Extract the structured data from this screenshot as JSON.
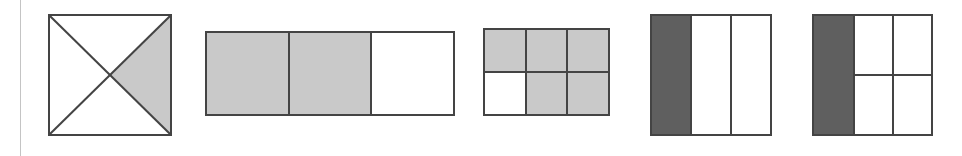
{
  "page": {
    "background_color": "#ffffff",
    "width": 962,
    "height": 156,
    "margin_rule_color": "#c4c4c4"
  },
  "palette": {
    "outline": "#444444",
    "shade_light": "#c9c9c9",
    "shade_dark": "#5f5f5f",
    "unshaded": "#ffffff"
  },
  "figures": [
    {
      "id": "figure-1",
      "name": "square-with-diagonals",
      "description": "Square divided by both diagonals into four triangles; the right triangle is shaded light gray.",
      "shape": "square",
      "division": "diagonals",
      "total_parts": 4,
      "shaded_parts": 1,
      "fraction": "1/4",
      "shade_color": "#c9c9c9",
      "shaded_regions": [
        "right"
      ],
      "x": 48,
      "y": 14,
      "width": 124,
      "height": 122
    },
    {
      "id": "figure-2",
      "name": "rectangle-thirds-columns",
      "description": "Wide rectangle split into three equal vertical columns; the left two columns are shaded light gray.",
      "shape": "rectangle",
      "division": "vertical-thirds",
      "columns": 3,
      "rows": 1,
      "total_parts": 3,
      "shaded_parts": 2,
      "fraction": "2/3",
      "shade_color": "#c9c9c9",
      "cells": [
        "shaded",
        "shaded",
        "unshaded"
      ],
      "x": 205,
      "y": 31,
      "width": 250,
      "height": 85
    },
    {
      "id": "figure-3",
      "name": "rectangle-six-cell-grid",
      "description": "Rectangle split into a three column by two row grid of six cells; five cells are shaded light gray and the bottom left cell is unshaded.",
      "shape": "rectangle",
      "division": "grid",
      "columns": 3,
      "rows": 2,
      "total_parts": 6,
      "shaded_parts": 5,
      "fraction": "5/6",
      "shade_color": "#c9c9c9",
      "cells": [
        "shaded",
        "shaded",
        "shaded",
        "unshaded",
        "shaded",
        "shaded"
      ],
      "x": 483,
      "y": 28,
      "width": 127,
      "height": 88
    },
    {
      "id": "figure-4",
      "name": "square-thirds-columns",
      "description": "Square split into three equal vertical columns; the leftmost column is shaded dark gray.",
      "shape": "square",
      "division": "vertical-thirds",
      "columns": 3,
      "rows": 1,
      "total_parts": 3,
      "shaded_parts": 1,
      "fraction": "1/3",
      "shade_color": "#5f5f5f",
      "cells": [
        "shaded",
        "unshaded",
        "unshaded"
      ],
      "x": 650,
      "y": 14,
      "width": 122,
      "height": 122
    },
    {
      "id": "figure-5",
      "name": "square-third-band-with-quarters",
      "description": "Square with a dark gray left band one third wide; the remaining two thirds are divided into a two by two block of four unshaded cells.",
      "shape": "square",
      "division": "left-band-plus-2x2",
      "total_parts": 5,
      "shaded_parts": 1,
      "fraction": "1/3",
      "shade_color": "#5f5f5f",
      "left_band_fraction": "1/3",
      "right_block_columns": 2,
      "right_block_rows": 2,
      "cells": [
        "shaded",
        "unshaded",
        "unshaded",
        "unshaded",
        "unshaded"
      ],
      "x": 812,
      "y": 14,
      "width": 121,
      "height": 122
    }
  ]
}
